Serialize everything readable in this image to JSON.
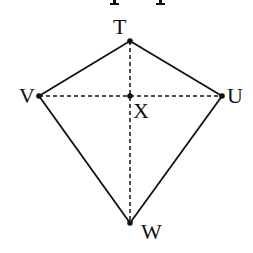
{
  "diagram": {
    "type": "kite",
    "vertices": [
      {
        "id": "T",
        "label": "T",
        "x": 130,
        "y": 41
      },
      {
        "id": "U",
        "label": "U",
        "x": 222,
        "y": 96
      },
      {
        "id": "W",
        "label": "W",
        "x": 130,
        "y": 223
      },
      {
        "id": "V",
        "label": "V",
        "x": 39,
        "y": 96
      }
    ],
    "intersection": {
      "id": "X",
      "label": "X",
      "x": 130,
      "y": 96
    },
    "edges": [
      [
        "T",
        "U"
      ],
      [
        "U",
        "W"
      ],
      [
        "W",
        "V"
      ],
      [
        "V",
        "T"
      ]
    ],
    "diagonals": [
      [
        "T",
        "W"
      ],
      [
        "V",
        "U"
      ]
    ],
    "diagonal_style": "dashed",
    "stroke_color": "#111111",
    "background": "#ffffff"
  },
  "top_text_fragment": "cut-off text (descenders only visible)"
}
